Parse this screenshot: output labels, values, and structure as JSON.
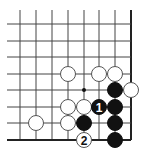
{
  "board": {
    "view": "bottom-right corner",
    "columns_x": [
      20,
      36,
      52,
      68,
      84,
      99,
      115,
      131
    ],
    "rows_y": [
      24,
      41,
      57,
      74,
      90,
      107,
      123,
      140
    ],
    "line_top_start": 10,
    "line_left_start": 7,
    "stone_radius": 7.5,
    "colors": {
      "black": "#111111",
      "white": "#ffffff",
      "line": "#444444"
    },
    "star_points": [
      {
        "col": 4,
        "row": 4
      }
    ],
    "stones": [
      {
        "color": "white",
        "col": 3,
        "row": 3,
        "label": ""
      },
      {
        "color": "white",
        "col": 5,
        "row": 3,
        "label": ""
      },
      {
        "color": "white",
        "col": 6,
        "row": 3,
        "label": ""
      },
      {
        "color": "black",
        "col": 6,
        "row": 4,
        "label": ""
      },
      {
        "color": "white",
        "col": 7,
        "row": 4,
        "label": ""
      },
      {
        "color": "white",
        "col": 3,
        "row": 5,
        "label": ""
      },
      {
        "color": "white",
        "col": 4,
        "row": 5,
        "label": ""
      },
      {
        "color": "black",
        "col": 5,
        "row": 5,
        "label": "1"
      },
      {
        "color": "black",
        "col": 6,
        "row": 5,
        "label": ""
      },
      {
        "color": "white",
        "col": 1,
        "row": 6,
        "label": ""
      },
      {
        "color": "white",
        "col": 3,
        "row": 6,
        "label": ""
      },
      {
        "color": "black",
        "col": 4,
        "row": 6,
        "label": ""
      },
      {
        "color": "black",
        "col": 6,
        "row": 6,
        "label": ""
      },
      {
        "color": "white",
        "col": 4,
        "row": 7,
        "label": "2"
      },
      {
        "color": "black",
        "col": 6,
        "row": 7,
        "label": ""
      }
    ]
  }
}
